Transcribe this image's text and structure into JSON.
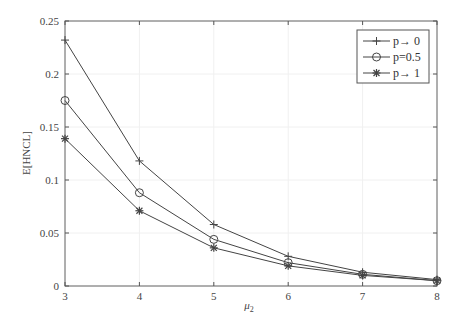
{
  "chart_data": {
    "type": "line",
    "title": "",
    "xlabel": "μ2",
    "xlabel_main": "μ",
    "xlabel_sub": "2",
    "ylabel": "E[HNCL]",
    "x": [
      3,
      4,
      5,
      6,
      7,
      8
    ],
    "xlim": [
      3,
      8
    ],
    "ylim": [
      0,
      0.25
    ],
    "xticks": [
      "3",
      "4",
      "5",
      "6",
      "7",
      "8"
    ],
    "yticks": [
      "0",
      "0.05",
      "0.1",
      "0.15",
      "0.2",
      "0.25"
    ],
    "grid": true,
    "legend_position": "upper right",
    "series": [
      {
        "name": "p→ 0",
        "marker": "plus",
        "values": [
          0.232,
          0.118,
          0.058,
          0.028,
          0.013,
          0.006
        ]
      },
      {
        "name": "p=0.5",
        "marker": "circle",
        "values": [
          0.175,
          0.088,
          0.044,
          0.022,
          0.011,
          0.005
        ]
      },
      {
        "name": "p→ 1",
        "marker": "star",
        "values": [
          0.139,
          0.071,
          0.036,
          0.019,
          0.01,
          0.005
        ]
      }
    ]
  },
  "colors": {
    "line": "#444444",
    "axis": "#555555",
    "grid": "#f0f0f0"
  }
}
